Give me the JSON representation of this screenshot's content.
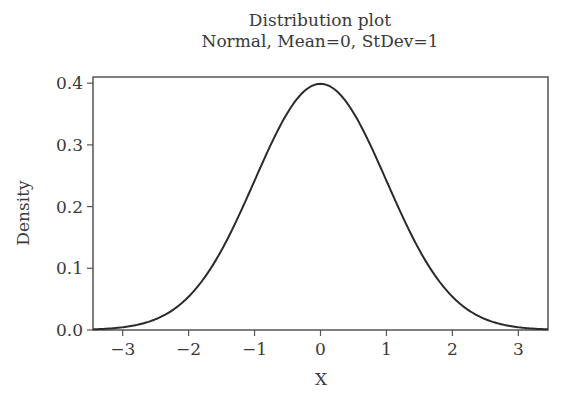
{
  "chart_data": {
    "type": "line",
    "title": "Distribution plot",
    "subtitle": "Normal, Mean=0, StDev=1",
    "xlabel": "X",
    "ylabel": "Density",
    "xlim": [
      -3.45,
      3.45
    ],
    "ylim": [
      0,
      0.41
    ],
    "xticks": [
      -3,
      -2,
      -1,
      0,
      1,
      2,
      3
    ],
    "xtick_labels": [
      "−3",
      "−2",
      "−1",
      "0",
      "1",
      "2",
      "3"
    ],
    "yticks": [
      0.0,
      0.1,
      0.2,
      0.3,
      0.4
    ],
    "ytick_labels": [
      "0.0",
      "0.1",
      "0.2",
      "0.3",
      "0.4"
    ],
    "grid": false,
    "legend": null,
    "series": [
      {
        "name": "Normal(0,1) PDF",
        "distribution": "normal",
        "mean": 0,
        "stdev": 1,
        "x": [
          -3.45,
          -3,
          -2.5,
          -2,
          -1.5,
          -1,
          -0.5,
          0,
          0.5,
          1,
          1.5,
          2,
          2.5,
          3,
          3.45
        ],
        "y": [
          0.001,
          0.004,
          0.018,
          0.054,
          0.13,
          0.242,
          0.352,
          0.399,
          0.352,
          0.242,
          0.13,
          0.054,
          0.018,
          0.004,
          0.001
        ]
      }
    ],
    "colors": {
      "line": "#2b2b2b",
      "axis": "#555555",
      "text": "#3a3a3a"
    }
  }
}
